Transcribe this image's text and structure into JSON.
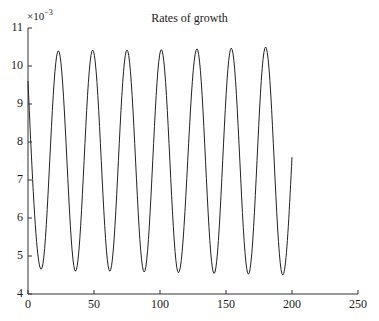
{
  "chart_data": {
    "type": "line",
    "title": "Rates of growth",
    "xlabel": "",
    "ylabel": "",
    "y_multiplier": "×10^-3",
    "y_multiplier_base": "×10",
    "y_multiplier_exp": "−3",
    "xlim": [
      0,
      250
    ],
    "ylim": [
      4,
      11
    ],
    "x_ticks": [
      0,
      50,
      100,
      150,
      200,
      250
    ],
    "y_ticks": [
      4,
      5,
      6,
      7,
      8,
      9,
      10,
      11
    ],
    "grid": false,
    "legend": null,
    "series": [
      {
        "name": "rate",
        "color": "#222222",
        "period": 26.2,
        "amplitude": 2.9,
        "mean": 7.55,
        "x_start": 0,
        "x_end": 200,
        "start_value": 9.6,
        "end_value": 7.6,
        "peaks": [
          [
            23,
            10.4
          ],
          [
            49,
            10.42
          ],
          [
            75,
            10.42
          ],
          [
            101,
            10.43
          ],
          [
            128,
            10.45
          ],
          [
            154,
            10.47
          ],
          [
            180,
            10.5
          ]
        ],
        "troughs": [
          [
            10,
            4.65
          ],
          [
            36,
            4.6
          ],
          [
            62,
            4.6
          ],
          [
            88,
            4.58
          ],
          [
            114,
            4.56
          ],
          [
            141,
            4.54
          ],
          [
            167,
            4.52
          ],
          [
            193,
            4.5
          ]
        ]
      }
    ]
  }
}
